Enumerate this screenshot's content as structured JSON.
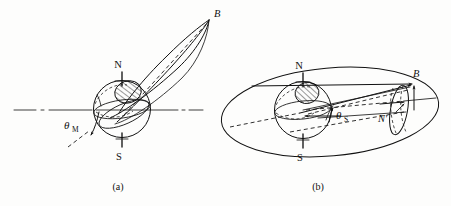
{
  "figure": {
    "kind": "scientific-line-diagram",
    "background_color": "#fdfdfc",
    "ink_color": "#111111",
    "panels": [
      {
        "id": "a",
        "caption": "(a)",
        "labels": {
          "north_pole": "N",
          "south_pole": "S",
          "field_point": "B",
          "angle": "θ",
          "angle_subscript": "M"
        },
        "elements": [
          "horizontal-dash-dot-axis",
          "earth-sphere",
          "polar-cap-hatched",
          "elongated-orbit-loop",
          "dashed-orbit-centerline",
          "tilt-angle-arc",
          "tilted-axis-dashed-stub"
        ]
      },
      {
        "id": "b",
        "caption": "(b)",
        "labels": {
          "north_pole": "N",
          "south_pole": "S",
          "field_point": "B",
          "secondary_point": "N′",
          "angle": "θ",
          "angle_subscript": "S"
        },
        "elements": [
          "large-orbit-ellipse",
          "earth-sphere",
          "polar-cap-hatched",
          "equator-ellipse",
          "convergent-rays-to-B",
          "inclined-dash-dot-axis",
          "small-terminal-ellipse",
          "field-arrows"
        ]
      }
    ]
  }
}
